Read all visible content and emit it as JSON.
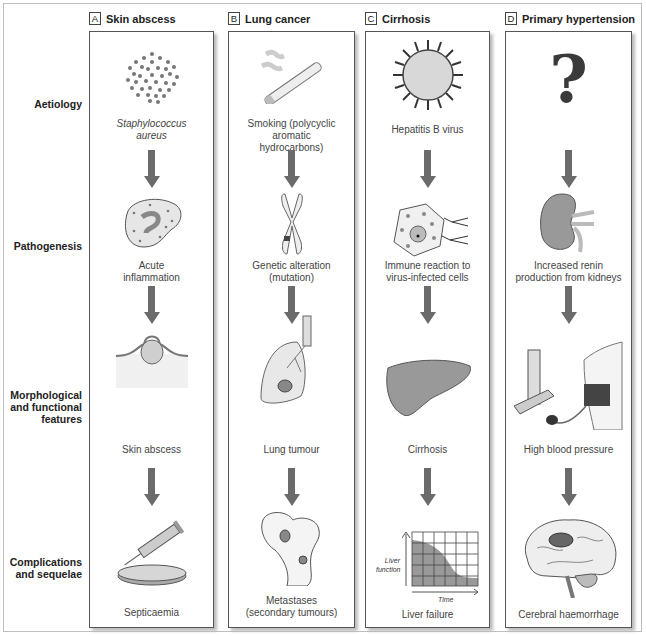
{
  "row_labels": [
    {
      "text": "Aetiology"
    },
    {
      "text": "Pathogenesis"
    },
    {
      "text": "Morphological and functional features"
    },
    {
      "text": "Complications and sequelae"
    }
  ],
  "columns": [
    {
      "letter": "A",
      "title": "Skin abscess",
      "captions": [
        "Staphylococcus aureus",
        "Acute inflammation",
        "Skin abscess",
        "Septicaemia"
      ],
      "illustrations": [
        "bacteria-cluster",
        "inflammatory-cell",
        "skin-abscess",
        "syringe-and-petri-dish"
      ]
    },
    {
      "letter": "B",
      "title": "Lung cancer",
      "captions": [
        "Smoking (polycyclic aromatic hydrocarbons)",
        "Genetic alteration (mutation)",
        "Lung tumour",
        "Metastases (secondary tumours)"
      ],
      "illustrations": [
        "cigarette",
        "chromosome",
        "lung-with-tumour",
        "bone-with-metastases"
      ]
    },
    {
      "letter": "C",
      "title": "Cirrhosis",
      "captions": [
        "Hepatitis B virus",
        "Immune reaction to virus-infected cells",
        "Cirrhosis",
        "Liver failure"
      ],
      "illustrations": [
        "virus",
        "infected-cell-with-antibodies",
        "cirrhotic-liver",
        "liver-function-graph"
      ]
    },
    {
      "letter": "D",
      "title": "Primary hypertension",
      "captions": [
        "?",
        "Increased renin production from kidneys",
        "High blood pressure",
        "Cerebral haemorrhage"
      ],
      "illustrations": [
        "question-mark",
        "kidney",
        "sphygmomanometer",
        "brain-haemorrhage"
      ]
    }
  ],
  "liver_graph": {
    "ylabel": "Liver function",
    "xlabel": "Time"
  },
  "colors": {
    "arrow": "#6b6b6b",
    "border": "#555555",
    "illustration_gray": "#8a8a8a"
  }
}
